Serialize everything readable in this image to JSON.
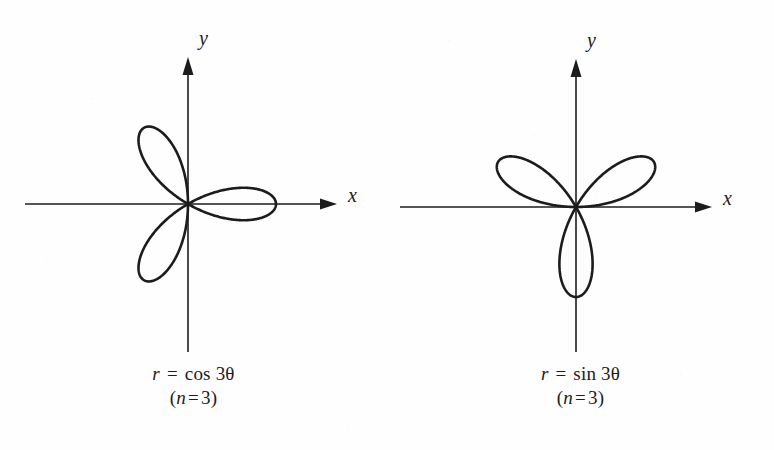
{
  "figure": {
    "background_color": "#fefefe",
    "ink_color": "#1c1c1c",
    "panels": [
      {
        "id": "cos-3theta",
        "axis_x_label": "x",
        "axis_y_label": "y",
        "caption_equation_lhs": "r",
        "caption_equation_op": "=",
        "caption_equation_rhs": "cos 3θ",
        "caption_equation_full": "r = cos 3θ",
        "caption_petals_prefix": "(",
        "caption_petals_var": "n",
        "caption_petals_op": "=",
        "caption_petals_value": "3",
        "caption_petals_suffix": ")",
        "caption_petals_full": "(n = 3)"
      },
      {
        "id": "sin-3theta",
        "axis_x_label": "x",
        "axis_y_label": "y",
        "caption_equation_lhs": "r",
        "caption_equation_op": "=",
        "caption_equation_rhs": "sin 3θ",
        "caption_equation_full": "r = sin 3θ",
        "caption_petals_prefix": "(",
        "caption_petals_var": "n",
        "caption_petals_op": "=",
        "caption_petals_value": "3",
        "caption_petals_suffix": ")",
        "caption_petals_full": "(n = 3)"
      }
    ]
  },
  "chart_data": [
    {
      "type": "line",
      "subtype": "polar-rose",
      "title": "r = cos 3θ",
      "annotations": [
        "r = cos 3θ",
        "(n = 3)"
      ],
      "equation": "r = cos(3*theta)",
      "petal_count": 3,
      "petal_angles_deg": [
        0,
        120,
        240
      ],
      "max_radius": 1,
      "xlabel": "x",
      "ylabel": "y",
      "grid": false,
      "legend": false,
      "axes": {
        "x_arrow": true,
        "y_arrow": true,
        "x_range": [
          -1.85,
          1.7
        ],
        "y_range": [
          -1.7,
          1.7
        ]
      }
    },
    {
      "type": "line",
      "subtype": "polar-rose",
      "title": "r = sin 3θ",
      "annotations": [
        "r = sin 3θ",
        "(n = 3)"
      ],
      "equation": "r = sin(3*theta)",
      "petal_count": 3,
      "petal_angles_deg": [
        30,
        150,
        270
      ],
      "max_radius": 1,
      "xlabel": "x",
      "ylabel": "y",
      "grid": false,
      "legend": false,
      "axes": {
        "x_arrow": true,
        "y_arrow": true,
        "x_range": [
          -1.85,
          1.7
        ],
        "y_range": [
          -1.7,
          1.7
        ]
      }
    }
  ]
}
